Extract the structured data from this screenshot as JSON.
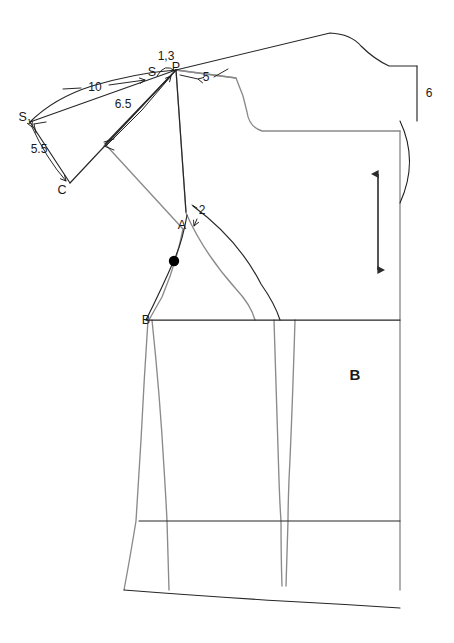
{
  "document": {
    "type": "sewing-pattern-draft",
    "title": "Bodice and sleeve pattern draft",
    "background_color": "#ffffff",
    "width": 454,
    "height": 643
  },
  "colors": {
    "pattern_outline": "#8a8a8a",
    "construction_line": "#262626",
    "measurement_text": "#1a1a1a",
    "grainline": "#2b2b2b",
    "notch_dot": "#000000"
  },
  "point_labels": [
    {
      "id": "S",
      "text": "S",
      "sub": "",
      "x": 152,
      "y": 73
    },
    {
      "id": "P",
      "text": "P",
      "sub": "",
      "x": 176,
      "y": 68
    },
    {
      "id": "S1",
      "text": "S",
      "sub": "1",
      "x": 25,
      "y": 118
    },
    {
      "id": "C",
      "text": "C",
      "sub": "",
      "x": 62,
      "y": 191
    },
    {
      "id": "A",
      "text": "A",
      "sub": "",
      "x": 182,
      "y": 226
    },
    {
      "id": "B",
      "text": "B",
      "sub": "",
      "x": 146,
      "y": 321
    }
  ],
  "measurements": [
    {
      "id": "m-10",
      "value": "10",
      "x": 94,
      "y": 89,
      "unit": "cm",
      "describes": "S1-to-S sleeve cap span"
    },
    {
      "id": "m-13",
      "value": "1,3",
      "x": 165,
      "y": 57,
      "unit": "cm",
      "describes": "S to P shoulder extension"
    },
    {
      "id": "m-5",
      "value": "5",
      "x": 205,
      "y": 79,
      "unit": "cm",
      "describes": "P along shoulder line"
    },
    {
      "id": "m-65",
      "value": "6.5",
      "x": 122,
      "y": 105,
      "unit": "cm",
      "describes": "inner sleeve cap segment"
    },
    {
      "id": "m-55",
      "value": "5.5",
      "x": 38,
      "y": 150,
      "unit": "cm",
      "describes": "S1 to C sleeve underarm"
    },
    {
      "id": "m-2",
      "value": "2",
      "x": 201,
      "y": 211,
      "unit": "cm",
      "describes": "armhole notch offset above A"
    },
    {
      "id": "m-6",
      "value": "6",
      "x": 428,
      "y": 94,
      "unit": "cm",
      "describes": "center back neck drop"
    }
  ],
  "panel_labels": [
    {
      "id": "panel-B",
      "text": "B",
      "x": 355,
      "y": 376
    }
  ],
  "grainline": {
    "name": "grainline-arrow",
    "x": 378,
    "y_top": 172,
    "y_bottom": 272,
    "double_headed": true
  },
  "notch_dot": {
    "name": "balance-notch-dot",
    "x": 174,
    "y": 261,
    "radius": 5
  },
  "geometry": {
    "bodice_outline_gray": "M176,70 L236,78 L244,95 L248,110 Q250,126 263,131 L330,131 L400,131",
    "bodice_right_edge": "M400,131 L400,320 L400,521 L400,590",
    "shoulder_black": "M176,70 L330,33 Q352,34 362,45 Q375,58 388,66 L417,66",
    "neck_right_black": "M417,66 L417,121",
    "center_back_black": "M388,66 L417,66",
    "chest_line_black": "M146,320 L400,320",
    "waist_line_black": "M140,521 L400,521",
    "hem_black": "M124,590 L400,590",
    "side_seam_gray": "M148,320 L142,430 L138,521 L124,590",
    "armhole_gray": "M176,70 L186,215 Q200,250 233,286 Q250,303 254,320",
    "armhole_black_curve": "M193,207 Q240,240 262,285 Q276,305 280,320",
    "front_body_gray": "M151,320 Q160,400 163,470 L166,521 L168,590",
    "dart_left_gray": "M274,320 L277,440 L280,521 L281,586",
    "dart_right_gray": "M294,320 L291,440 L288,521 L286,586",
    "armhole_seam_gray": "M182,228 Q175,265 160,300 Q152,312 148,320",
    "sleeve_cap_black": "M30,122 Q70,85 140,76 Q160,74 176,70",
    "sleeve_s1_s_black": "M30,122 L176,70",
    "sleeve_c_s_black": "M70,183 L176,70",
    "sleeve_c_s1_black": "M70,183 L30,122",
    "sleeve_inner_black": "M105,144 L176,70",
    "sleeve_inner_gray": "M105,144 L182,228",
    "sleeve_arc_55": "M32,126 Q48,158 68,182",
    "sleeve_arc_65": "M110,141 Q145,108 172,74",
    "arc_13": "M158,76 Q166,64 174,72",
    "brace_6": "M399,121 Q418,160 399,202"
  }
}
